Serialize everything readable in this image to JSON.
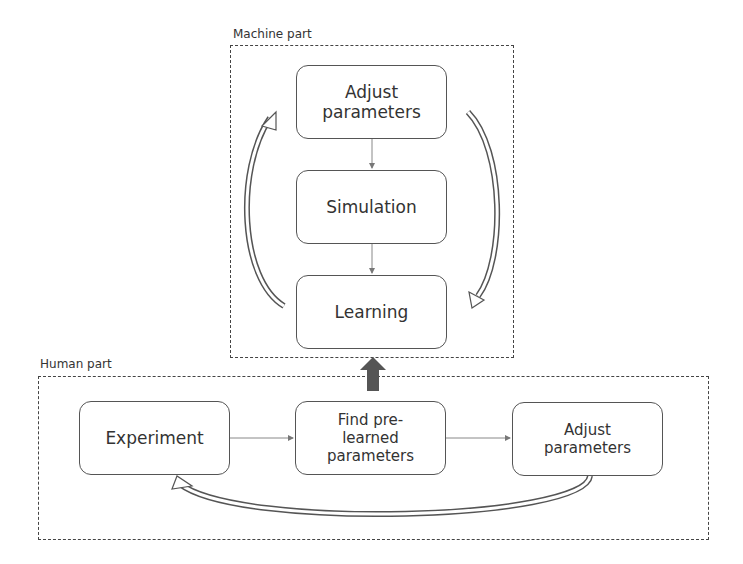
{
  "machine_part": {
    "label": "Machine part",
    "nodes": [
      {
        "id": "adjust",
        "label": "Adjust parameters"
      },
      {
        "id": "simulation",
        "label": "Simulation"
      },
      {
        "id": "learning",
        "label": "Learning"
      }
    ]
  },
  "human_part": {
    "label": "Human part",
    "nodes": [
      {
        "id": "experiment",
        "label": "Experiment"
      },
      {
        "id": "find",
        "label": "Find pre-learned parameters"
      },
      {
        "id": "adjust",
        "label": "Adjust parameters"
      }
    ]
  },
  "edges": [
    {
      "from": "Adjust parameters",
      "to": "Simulation"
    },
    {
      "from": "Simulation",
      "to": "Learning"
    },
    {
      "from": "Learning",
      "to": "Adjust parameters",
      "style": "loop-left"
    },
    {
      "from": "Adjust parameters",
      "to": "Learning",
      "style": "loop-right"
    },
    {
      "from": "Experiment",
      "to": "Find pre-learned parameters"
    },
    {
      "from": "Find pre-learned parameters",
      "to": "Adjust parameters"
    },
    {
      "from": "Adjust parameters",
      "to": "Experiment",
      "style": "feedback"
    },
    {
      "from": "Human part",
      "to": "Machine part",
      "style": "bold"
    }
  ]
}
